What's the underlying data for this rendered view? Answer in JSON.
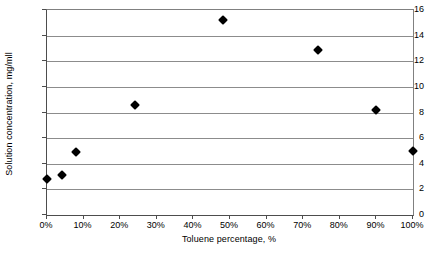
{
  "chart_data": {
    "type": "scatter",
    "title": "",
    "xlabel": "Toluene percentage, %",
    "ylabel": "Solution concentration, mg/mll",
    "xlim": [
      0,
      100
    ],
    "ylim": [
      0,
      16
    ],
    "grid": true,
    "legend": null,
    "x_tick_labels": [
      "0%",
      "10%",
      "20%",
      "30%",
      "40%",
      "50%",
      "60%",
      "70%",
      "80%",
      "90%",
      "100%"
    ],
    "x_ticks": [
      0,
      10,
      20,
      30,
      40,
      50,
      60,
      70,
      80,
      90,
      100
    ],
    "y_tick_labels": [
      "0",
      "2",
      "4",
      "6",
      "8",
      "10",
      "12",
      "14",
      "16"
    ],
    "y_ticks": [
      0,
      2,
      4,
      6,
      8,
      10,
      12,
      14,
      16
    ],
    "marker": "filled-diamond",
    "marker_color": "#000000",
    "series": [
      {
        "name": "Solution concentration",
        "points": [
          {
            "x": 0,
            "y": 2.8
          },
          {
            "x": 4,
            "y": 3.1
          },
          {
            "x": 8,
            "y": 4.9
          },
          {
            "x": 24,
            "y": 8.6
          },
          {
            "x": 48,
            "y": 15.2
          },
          {
            "x": 74,
            "y": 12.9
          },
          {
            "x": 90,
            "y": 8.2
          },
          {
            "x": 100,
            "y": 5.0
          }
        ]
      }
    ]
  }
}
